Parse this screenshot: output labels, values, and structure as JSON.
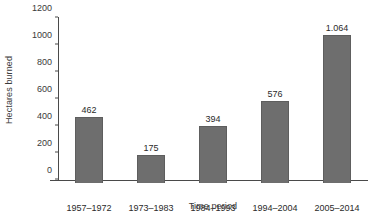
{
  "chart_data": {
    "type": "bar",
    "title": "",
    "xlabel": "Time period",
    "ylabel": "Hectares burned",
    "categories": [
      "1957–1972",
      "1973–1983",
      "1984–1993",
      "1994–2004",
      "2005–2014"
    ],
    "values": [
      462,
      175,
      394,
      576,
      1064
    ],
    "value_labels": [
      "462",
      "175",
      "394",
      "576",
      "1.064"
    ],
    "ylim": [
      0,
      1200
    ],
    "yticks": [
      0,
      200,
      400,
      600,
      800,
      1000,
      1200
    ],
    "ytick_labels": [
      "0",
      "200",
      "400",
      "600",
      "800",
      "1000",
      "1200"
    ],
    "grid": false,
    "legend": false,
    "legend_position": "none",
    "bar_color": "#6e6e6e",
    "axis_color": "#4a4a4a",
    "text_color": "#2a2a2a",
    "background": "#ffffff"
  }
}
